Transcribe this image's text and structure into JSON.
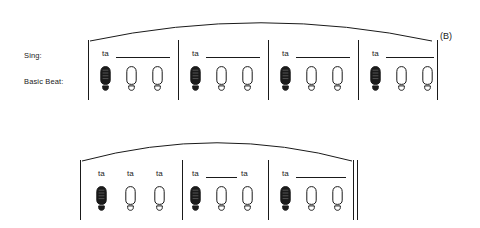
{
  "figure": {
    "section_letter": "(B)",
    "labels": {
      "sing": "Sing:",
      "basic_beat": "Basic Beat:"
    },
    "ink_color": "#1a1a1a",
    "page_color": "#ffffff"
  },
  "systems": [
    {
      "id": "system-1",
      "arc": {
        "start_x": 90,
        "end_x": 432,
        "peak_y": 14,
        "end_y": 41
      },
      "barlines": [
        {
          "x": 88,
          "top": 40,
          "bottom": 100
        },
        {
          "x": 178,
          "top": 40,
          "bottom": 100
        },
        {
          "x": 268,
          "top": 40,
          "bottom": 100
        },
        {
          "x": 358,
          "top": 40,
          "bottom": 100
        },
        {
          "x": 437,
          "top": 40,
          "bottom": 100
        }
      ],
      "end_barline": "single",
      "measures": [
        {
          "id": "m1",
          "syllables": [
            {
              "text": "ta",
              "x": 102,
              "y": 50,
              "line": {
                "x": 116,
                "y": 57,
                "width": 54
              }
            }
          ],
          "beats": [
            {
              "x": 100,
              "y": 66,
              "filled": true
            },
            {
              "x": 126,
              "y": 66,
              "filled": false
            },
            {
              "x": 152,
              "y": 66,
              "filled": false
            }
          ]
        },
        {
          "id": "m2",
          "syllables": [
            {
              "text": "ta",
              "x": 192,
              "y": 50,
              "line": {
                "x": 206,
                "y": 57,
                "width": 54
              }
            }
          ],
          "beats": [
            {
              "x": 190,
              "y": 66,
              "filled": true
            },
            {
              "x": 216,
              "y": 66,
              "filled": false
            },
            {
              "x": 242,
              "y": 66,
              "filled": false
            }
          ]
        },
        {
          "id": "m3",
          "syllables": [
            {
              "text": "ta",
              "x": 282,
              "y": 50,
              "line": {
                "x": 296,
                "y": 57,
                "width": 54
              }
            }
          ],
          "beats": [
            {
              "x": 280,
              "y": 66,
              "filled": true
            },
            {
              "x": 306,
              "y": 66,
              "filled": false
            },
            {
              "x": 332,
              "y": 66,
              "filled": false
            }
          ]
        },
        {
          "id": "m4",
          "syllables": [
            {
              "text": "ta",
              "x": 372,
              "y": 50,
              "line": {
                "x": 386,
                "y": 57,
                "width": 48
              }
            }
          ],
          "beats": [
            {
              "x": 370,
              "y": 66,
              "filled": true
            },
            {
              "x": 396,
              "y": 66,
              "filled": false
            },
            {
              "x": 422,
              "y": 66,
              "filled": false
            }
          ]
        }
      ]
    },
    {
      "id": "system-2",
      "arc": {
        "start_x": 82,
        "end_x": 352,
        "peak_y": 134,
        "end_y": 161
      },
      "barlines": [
        {
          "x": 80,
          "top": 160,
          "bottom": 220
        },
        {
          "x": 182,
          "top": 160,
          "bottom": 220
        },
        {
          "x": 268,
          "top": 160,
          "bottom": 220
        },
        {
          "x": 353,
          "top": 160,
          "bottom": 220
        },
        {
          "x": 357,
          "top": 160,
          "bottom": 220
        }
      ],
      "end_barline": "double-thin",
      "measures": [
        {
          "id": "m5",
          "syllables": [
            {
              "text": "ta",
              "x": 98,
              "y": 170,
              "line": null
            },
            {
              "text": "ta",
              "x": 127,
              "y": 170,
              "line": null
            },
            {
              "text": "ta",
              "x": 156,
              "y": 170,
              "line": null
            }
          ],
          "beats": [
            {
              "x": 96,
              "y": 186,
              "filled": true
            },
            {
              "x": 125,
              "y": 186,
              "filled": false
            },
            {
              "x": 154,
              "y": 186,
              "filled": false
            }
          ]
        },
        {
          "id": "m6",
          "syllables": [
            {
              "text": "ta",
              "x": 192,
              "y": 170,
              "line": {
                "x": 206,
                "y": 177,
                "width": 31
              }
            },
            {
              "text": "ta",
              "x": 241,
              "y": 170,
              "line": null
            }
          ],
          "beats": [
            {
              "x": 190,
              "y": 186,
              "filled": true
            },
            {
              "x": 216,
              "y": 186,
              "filled": false
            },
            {
              "x": 242,
              "y": 186,
              "filled": false
            }
          ]
        },
        {
          "id": "m7",
          "syllables": [
            {
              "text": "ta",
              "x": 282,
              "y": 170,
              "line": {
                "x": 296,
                "y": 177,
                "width": 50
              }
            }
          ],
          "beats": [
            {
              "x": 280,
              "y": 186,
              "filled": true
            },
            {
              "x": 306,
              "y": 186,
              "filled": false
            },
            {
              "x": 332,
              "y": 186,
              "filled": false
            }
          ]
        }
      ]
    }
  ],
  "section_letter_pos": {
    "x": 440,
    "y": 32
  }
}
